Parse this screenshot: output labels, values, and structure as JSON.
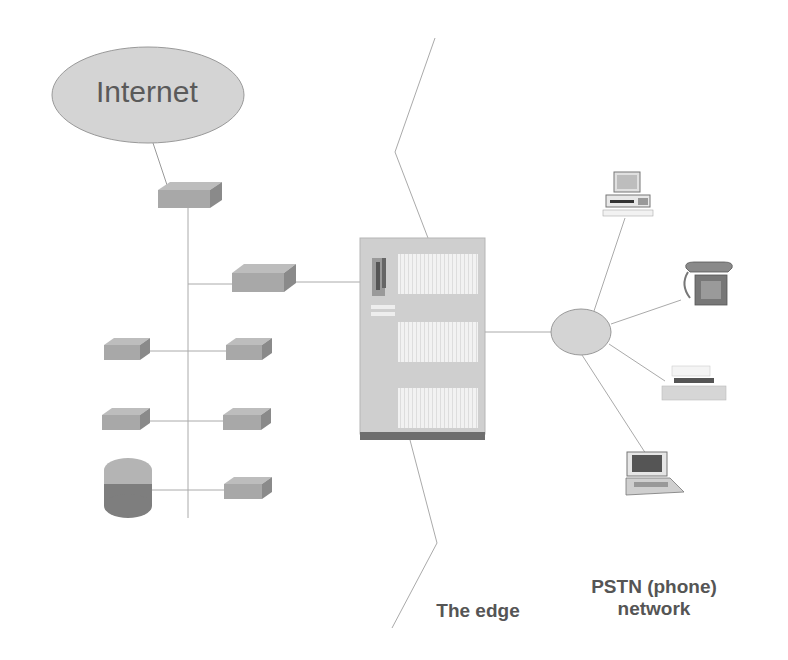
{
  "diagram": {
    "title": "",
    "nodes": {
      "internet": {
        "label": "Internet",
        "icon": "cloud-ellipse"
      },
      "router": {
        "icon": "router-box"
      },
      "lan_devices": [
        {
          "icon": "hub-box",
          "side": "right",
          "row": 1
        },
        {
          "icon": "hub-box",
          "side": "left",
          "row": 2
        },
        {
          "icon": "hub-box",
          "side": "right",
          "row": 2
        },
        {
          "icon": "hub-box",
          "side": "left",
          "row": 3
        },
        {
          "icon": "hub-box",
          "side": "right",
          "row": 3
        },
        {
          "icon": "database-cylinder",
          "side": "left",
          "row": 4
        },
        {
          "icon": "hub-box",
          "side": "right",
          "row": 4
        }
      ],
      "switch": {
        "icon": "pbx-cabinet"
      },
      "pstn_hub": {
        "icon": "pstn-ellipse"
      },
      "pstn_devices": [
        {
          "icon": "desktop-computer"
        },
        {
          "icon": "telephone"
        },
        {
          "icon": "printer"
        },
        {
          "icon": "laptop"
        }
      ]
    },
    "labels": {
      "internet": "Internet",
      "edge": "The edge",
      "pstn_line1": "PSTN (phone)",
      "pstn_line2": "network"
    },
    "colors": {
      "ellipse_fill": "#d4d4d4",
      "box_fill": "#a8a8a8",
      "box_side": "#8a8a8a",
      "line": "#999999",
      "text": "#555555",
      "cabinet_fill": "#cfcfcf",
      "cabinet_base": "#6e6e6e"
    }
  }
}
